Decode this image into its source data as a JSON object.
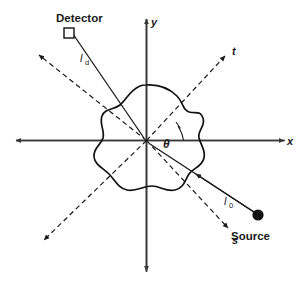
{
  "figure": {
    "axes": {
      "x_label": "x",
      "y_label": "y",
      "s_label": "s",
      "t_label": "t"
    },
    "angle": {
      "symbol": "θ"
    },
    "source": {
      "label": "Source",
      "marker": "filled-circle"
    },
    "detector": {
      "label": "Detector",
      "marker": "open-square"
    },
    "paths": {
      "source_path_label": "l",
      "source_path_sub": "0",
      "detector_path_label": "l",
      "detector_path_sub": "d"
    },
    "object": {
      "name": "medium-blob"
    },
    "colors": {
      "ink": "#1a1a1a",
      "background": "#ffffff"
    }
  }
}
